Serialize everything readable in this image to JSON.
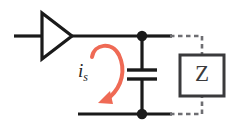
{
  "figure": {
    "kind": "circuit-schematic",
    "title": "",
    "background_color": "#ffffff",
    "width": 238,
    "height": 139
  },
  "colors": {
    "wire": "#1a1a1a",
    "component_outline": "#3a3a3c",
    "dashed_wire": "#6e6e72",
    "current_arrow": "#ef6a55",
    "label_text": "#242426",
    "z_text": "#3a3a3c"
  },
  "components": {
    "amplifier": {
      "name": "amplifier",
      "symbol": "triangle",
      "label": "",
      "input_terminal": "left",
      "output_terminal": "right"
    },
    "capacitor": {
      "name": "capacitor",
      "symbol": "parallel-plates",
      "label": "",
      "orientation": "vertical",
      "connection": "shunt"
    },
    "impedance": {
      "name": "impedance-block",
      "symbol": "box",
      "label": "Z",
      "connection": "dashed"
    }
  },
  "nodes": {
    "top_node": {
      "name": "top-junction",
      "label": ""
    },
    "bottom_node": {
      "name": "bottom-junction",
      "label": ""
    }
  },
  "annotations": {
    "current_arrow": {
      "name": "current-arrow",
      "symbol_base": "i",
      "symbol_subscript": "s",
      "direction": "clockwise-down",
      "color": "#ef6a55"
    }
  }
}
